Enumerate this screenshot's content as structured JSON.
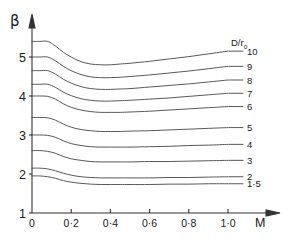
{
  "figure": {
    "title": "",
    "axis_label_y": "β",
    "axis_label_x": "M"
  },
  "axes": {
    "y_ticks": [
      "5",
      "4",
      "3",
      "2",
      "1"
    ],
    "y_tick_values": [
      5,
      4,
      3,
      2,
      1
    ],
    "x_ticks": [
      "0",
      "0·2",
      "0·4",
      "0·6",
      "0·8",
      "1·0"
    ],
    "x_tick_values": [
      0,
      0.2,
      0.4,
      0.6,
      0.8,
      1.0
    ]
  },
  "legend": {
    "header": "D/r",
    "header_sub": "o",
    "entries": [
      "10",
      "9",
      "8",
      "7",
      "6",
      "5",
      "4",
      "3",
      "2",
      "1·5"
    ]
  },
  "colors": {
    "curve": "#3a3a3a",
    "axis": "#333333",
    "background": "#ffffff"
  },
  "chart_data": {
    "type": "line",
    "title": "",
    "xlabel": "M",
    "ylabel": "β",
    "xlim": [
      0,
      1.22
    ],
    "ylim": [
      1,
      5.75
    ],
    "grid": false,
    "legend_position": "right",
    "legend_title": "D/r0",
    "x": [
      0,
      0.04,
      0.08,
      0.12,
      0.16,
      0.2,
      0.25,
      0.3,
      0.35,
      0.4,
      0.45,
      0.5,
      0.6,
      0.7,
      0.8,
      0.9,
      1.0
    ],
    "series": [
      {
        "name": "10",
        "values": [
          5.4,
          5.4,
          5.4,
          5.28,
          5.12,
          5.0,
          4.88,
          4.82,
          4.8,
          4.8,
          4.82,
          4.84,
          4.89,
          4.95,
          5.01,
          5.08,
          5.15
        ]
      },
      {
        "name": "9",
        "values": [
          5.0,
          5.0,
          5.0,
          4.9,
          4.76,
          4.65,
          4.55,
          4.49,
          4.47,
          4.47,
          4.48,
          4.5,
          4.54,
          4.59,
          4.64,
          4.7,
          4.76
        ]
      },
      {
        "name": "8",
        "values": [
          4.65,
          4.65,
          4.65,
          4.56,
          4.43,
          4.33,
          4.24,
          4.19,
          4.17,
          4.17,
          4.18,
          4.19,
          4.23,
          4.27,
          4.31,
          4.36,
          4.41
        ]
      },
      {
        "name": "7",
        "values": [
          4.3,
          4.3,
          4.3,
          4.22,
          4.1,
          4.01,
          3.93,
          3.89,
          3.87,
          3.87,
          3.88,
          3.89,
          3.92,
          3.95,
          3.99,
          4.03,
          4.07
        ]
      },
      {
        "name": "6",
        "values": [
          4.0,
          4.0,
          3.99,
          3.92,
          3.8,
          3.71,
          3.64,
          3.6,
          3.58,
          3.58,
          3.58,
          3.59,
          3.61,
          3.64,
          3.67,
          3.7,
          3.73
        ]
      },
      {
        "name": "5",
        "values": [
          3.45,
          3.45,
          3.44,
          3.38,
          3.28,
          3.2,
          3.14,
          3.11,
          3.09,
          3.09,
          3.09,
          3.1,
          3.11,
          3.13,
          3.15,
          3.17,
          3.19
        ]
      },
      {
        "name": "4",
        "values": [
          3.0,
          3.0,
          2.99,
          2.94,
          2.85,
          2.78,
          2.73,
          2.7,
          2.69,
          2.69,
          2.69,
          2.69,
          2.7,
          2.71,
          2.73,
          2.74,
          2.76
        ]
      },
      {
        "name": "3",
        "values": [
          2.6,
          2.6,
          2.58,
          2.53,
          2.45,
          2.39,
          2.35,
          2.32,
          2.31,
          2.31,
          2.31,
          2.31,
          2.32,
          2.32,
          2.33,
          2.34,
          2.35
        ]
      },
      {
        "name": "2",
        "values": [
          2.15,
          2.15,
          2.13,
          2.08,
          2.02,
          1.97,
          1.93,
          1.91,
          1.9,
          1.9,
          1.9,
          1.9,
          1.9,
          1.91,
          1.91,
          1.92,
          1.93
        ]
      },
      {
        "name": "1·5",
        "values": [
          1.95,
          1.95,
          1.93,
          1.89,
          1.83,
          1.79,
          1.76,
          1.74,
          1.73,
          1.73,
          1.73,
          1.73,
          1.73,
          1.74,
          1.74,
          1.75,
          1.75
        ]
      }
    ]
  }
}
